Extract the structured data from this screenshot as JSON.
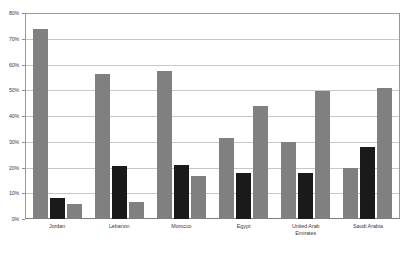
{
  "chart_data": {
    "type": "bar",
    "title": "",
    "subtitle": "",
    "xlabel": "",
    "ylabel": "",
    "ylim": [
      0,
      80
    ],
    "ytick_labels": [
      "80%",
      "70%",
      "60%",
      "50%",
      "40%",
      "30%",
      "20%",
      "10%",
      "0%"
    ],
    "ytick_values": [
      80,
      70,
      60,
      50,
      40,
      30,
      20,
      10,
      0
    ],
    "grid": true,
    "legend": "none",
    "categories": [
      "Jordan",
      "Lebanon",
      "Morocco",
      "Egypt",
      "United Arab Emirates",
      "Saudi Arabia"
    ],
    "category_lines": [
      [
        "Jordan"
      ],
      [
        "Lebanon"
      ],
      [
        "Morocco"
      ],
      [
        "Egypt"
      ],
      [
        "United Arab",
        "Emirates"
      ],
      [
        "Saudi Arabia"
      ]
    ],
    "series": [
      {
        "name": "series-1",
        "color": "#808080",
        "values": [
          74.0,
          56.7,
          57.8,
          31.5,
          30.0,
          20.0
        ]
      },
      {
        "name": "series-2",
        "color": "#1a1a1a",
        "values": [
          8.3,
          20.7,
          21.0,
          18.0,
          18.0,
          28.0
        ]
      },
      {
        "name": "series-3",
        "color": "#808080",
        "values": [
          6.0,
          6.5,
          16.6,
          44.0,
          50.0,
          51.0
        ]
      }
    ]
  },
  "style": {
    "background": "#ffffff",
    "gridline_color": "#c8c8c8",
    "axis_color": "#8d8d8d",
    "gray_bar": "#808080",
    "black_bar": "#1a1a1a",
    "text_color": "#3b3b3b"
  }
}
